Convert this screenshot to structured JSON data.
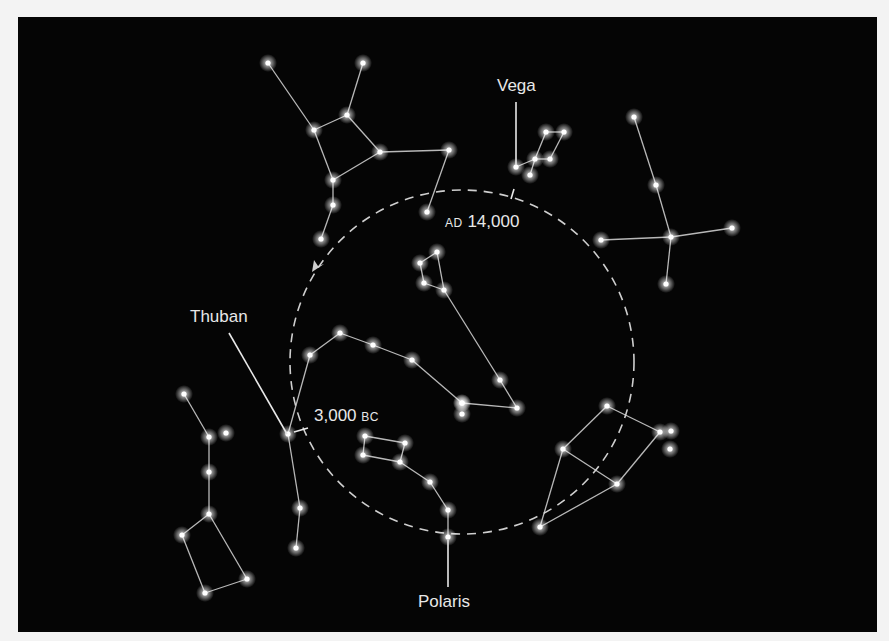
{
  "diagram": {
    "colors": {
      "background": "#050505",
      "lines": "#d8d8d8",
      "stars": "#ffffff",
      "text": "#e8e8e8",
      "page": "#f3f3f3"
    },
    "labels": {
      "vega": "Vega",
      "ad_prefix": "AD",
      "ad_year": "14,000",
      "thuban": "Thuban",
      "bc_year": "3,000",
      "bc_suffix": "BC",
      "polaris": "Polaris"
    },
    "precession_circle": {
      "cx": 462,
      "cy": 362,
      "r": 172,
      "style": "dashed",
      "arrow_direction": "counterclockwise"
    },
    "constellations": [
      {
        "name": "Hercules",
        "stars": [
          [
            268,
            63
          ],
          [
            363,
            63
          ],
          [
            314,
            130
          ],
          [
            347,
            115
          ],
          [
            380,
            152
          ],
          [
            333,
            180
          ],
          [
            449,
            150
          ],
          [
            333,
            205
          ],
          [
            321,
            239
          ],
          [
            427,
            212
          ]
        ],
        "lines": [
          [
            0,
            2
          ],
          [
            1,
            3
          ],
          [
            2,
            3
          ],
          [
            3,
            4
          ],
          [
            2,
            5
          ],
          [
            4,
            5
          ],
          [
            4,
            6
          ],
          [
            5,
            7
          ],
          [
            7,
            8
          ],
          [
            6,
            9
          ]
        ]
      },
      {
        "name": "Lyra",
        "stars": [
          [
            516,
            167
          ],
          [
            546,
            132
          ],
          [
            564,
            132
          ],
          [
            535,
            159
          ],
          [
            550,
            159
          ],
          [
            530,
            175
          ]
        ],
        "lines": [
          [
            0,
            3
          ],
          [
            3,
            1
          ],
          [
            1,
            2
          ],
          [
            2,
            4
          ],
          [
            4,
            3
          ],
          [
            3,
            5
          ]
        ]
      },
      {
        "name": "Cygnus",
        "stars": [
          [
            634,
            117
          ],
          [
            656,
            185
          ],
          [
            671,
            237
          ],
          [
            601,
            240
          ],
          [
            732,
            228
          ],
          [
            666,
            284
          ]
        ],
        "lines": [
          [
            0,
            1
          ],
          [
            1,
            2
          ],
          [
            3,
            2
          ],
          [
            2,
            4
          ],
          [
            2,
            5
          ]
        ]
      },
      {
        "name": "Ursa Minor central",
        "stars": [
          [
            420,
            263
          ],
          [
            437,
            252
          ],
          [
            424,
            283
          ],
          [
            444,
            290
          ],
          [
            500,
            380
          ],
          [
            517,
            408
          ],
          [
            462,
            403
          ],
          [
            462,
            414
          ]
        ],
        "lines": [
          [
            0,
            1
          ],
          [
            0,
            2
          ],
          [
            2,
            3
          ],
          [
            1,
            3
          ],
          [
            3,
            4
          ],
          [
            4,
            5
          ],
          [
            5,
            6
          ]
        ]
      },
      {
        "name": "Draco",
        "stars": [
          [
            310,
            355
          ],
          [
            340,
            333
          ],
          [
            373,
            345
          ],
          [
            412,
            360
          ],
          [
            462,
            403
          ],
          [
            288,
            434
          ],
          [
            300,
            508
          ],
          [
            296,
            548
          ]
        ],
        "lines": [
          [
            0,
            1
          ],
          [
            1,
            2
          ],
          [
            2,
            3
          ],
          [
            3,
            4
          ],
          [
            0,
            5
          ],
          [
            5,
            6
          ],
          [
            6,
            7
          ]
        ]
      },
      {
        "name": "Ursa Minor lower",
        "stars": [
          [
            365,
            436
          ],
          [
            405,
            443
          ],
          [
            363,
            455
          ],
          [
            400,
            462
          ],
          [
            430,
            482
          ],
          [
            448,
            510
          ],
          [
            448,
            537
          ]
        ],
        "lines": [
          [
            0,
            1
          ],
          [
            1,
            3
          ],
          [
            3,
            2
          ],
          [
            2,
            0
          ],
          [
            3,
            4
          ],
          [
            4,
            5
          ],
          [
            5,
            6
          ]
        ]
      },
      {
        "name": "Left constellation",
        "stars": [
          [
            184,
            394
          ],
          [
            209,
            437
          ],
          [
            226,
            433
          ],
          [
            209,
            472
          ],
          [
            209,
            514
          ],
          [
            182,
            535
          ],
          [
            205,
            593
          ],
          [
            247,
            579
          ]
        ],
        "lines": [
          [
            0,
            1
          ],
          [
            1,
            3
          ],
          [
            3,
            4
          ],
          [
            4,
            5
          ],
          [
            5,
            6
          ],
          [
            6,
            7
          ],
          [
            7,
            4
          ]
        ]
      },
      {
        "name": "Cepheus",
        "stars": [
          [
            607,
            406
          ],
          [
            563,
            449
          ],
          [
            617,
            484
          ],
          [
            660,
            432
          ],
          [
            671,
            431
          ],
          [
            670,
            449
          ],
          [
            540,
            527
          ]
        ],
        "lines": [
          [
            0,
            1
          ],
          [
            1,
            2
          ],
          [
            2,
            3
          ],
          [
            3,
            0
          ],
          [
            1,
            6
          ],
          [
            2,
            6
          ]
        ]
      }
    ]
  }
}
